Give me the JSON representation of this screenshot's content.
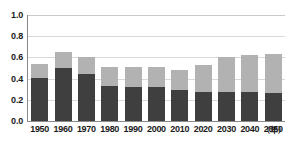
{
  "chart_data": {
    "type": "bar",
    "stacked": true,
    "title": "",
    "xlabel": "年",
    "ylabel": "",
    "ylim": [
      0.0,
      1.0
    ],
    "ytick_labels": [
      "1.0",
      "0.8",
      "0.6",
      "0.4",
      "0.2",
      "0.0"
    ],
    "ytick_values": [
      1.0,
      0.8,
      0.6,
      0.4,
      0.2,
      0.0
    ],
    "grid": true,
    "legend": "none",
    "categories": [
      "1950",
      "1960",
      "1970",
      "1980",
      "1990",
      "2000",
      "2010",
      "2020",
      "2030",
      "2040",
      "2050"
    ],
    "series": [
      {
        "name": "lower-segment",
        "color": "#3f3f3f",
        "values": [
          0.41,
          0.5,
          0.44,
          0.335,
          0.325,
          0.325,
          0.295,
          0.275,
          0.275,
          0.275,
          0.26
        ]
      },
      {
        "name": "upper-segment",
        "color": "#b2b2b2",
        "values": [
          0.125,
          0.155,
          0.165,
          0.175,
          0.185,
          0.185,
          0.185,
          0.255,
          0.325,
          0.345,
          0.375
        ]
      }
    ],
    "totals": [
      0.535,
      0.655,
      0.605,
      0.51,
      0.51,
      0.51,
      0.48,
      0.53,
      0.6,
      0.62,
      0.635
    ]
  },
  "axis": {
    "unit_label": "（年）"
  },
  "title_fragments": [
    {
      "text": "—",
      "left": 3
    },
    {
      "text": "——",
      "left": 22
    },
    {
      "text": "—",
      "left": 70
    }
  ],
  "colors": {
    "lower": "#3f3f3f",
    "upper": "#b2b2b2",
    "axis": "#8a8a8a",
    "grid": "#d9d9d9",
    "text": "#1a1a1a",
    "background": "#ffffff"
  }
}
